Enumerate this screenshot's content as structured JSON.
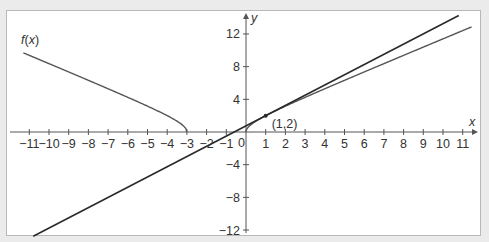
{
  "chart_data": {
    "type": "line",
    "title": "",
    "xlabel": "x",
    "ylabel": "y",
    "xlim": [
      -11.5,
      11.8
    ],
    "ylim": [
      -12.5,
      14
    ],
    "grid": false,
    "x_ticks": [
      -11,
      -10,
      -9,
      -8,
      -7,
      -6,
      -5,
      -4,
      -3,
      -2,
      -1,
      0,
      1,
      2,
      3,
      4,
      5,
      6,
      7,
      8,
      9,
      10,
      11
    ],
    "y_ticks": [
      -12,
      -8,
      -4,
      4,
      8,
      12
    ],
    "origin_label": "0",
    "series": [
      {
        "name": "f(x)",
        "label": "f(x)",
        "description": "curve y = sqrt(x^2 + 3x), branches x <= -3 and x >= 0",
        "points_left": [
          [
            -11.3,
            9.6
          ],
          [
            -10,
            8.37
          ],
          [
            -8,
            6.32
          ],
          [
            -6,
            4.24
          ],
          [
            -4,
            2.0
          ],
          [
            -3.5,
            1.32
          ],
          [
            -3,
            0
          ]
        ],
        "points_right": [
          [
            0,
            0
          ],
          [
            0.5,
            1.32
          ],
          [
            1,
            2
          ],
          [
            3,
            4.24
          ],
          [
            5,
            6.32
          ],
          [
            8,
            8.72
          ],
          [
            11.5,
            12.91
          ]
        ]
      },
      {
        "name": "tangent",
        "label": "",
        "description": "tangent line at (1,2): y = 1.25x + 0.75",
        "points": [
          [
            -10.8,
            -12.75
          ],
          [
            10.8,
            14.25
          ]
        ]
      }
    ],
    "annotations": [
      {
        "text": "(1,2)",
        "x": 1,
        "y": 2,
        "marker": "point"
      }
    ]
  },
  "labels": {
    "fx": "f(x)",
    "x_axis": "x",
    "y_axis": "y",
    "point": "(1,2)",
    "origin": "0"
  },
  "colors": {
    "background": "#ebebeb",
    "plot_bg": "#ffffff",
    "frame": "#b8b8b8",
    "axis": "#555555",
    "curve": "#555555",
    "tangent": "#2a2a2a",
    "text": "#333333"
  }
}
